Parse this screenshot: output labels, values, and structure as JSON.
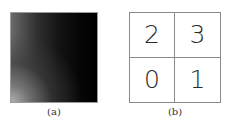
{
  "panel_a": {
    "caption": "(a)",
    "description": "grayscale gradient square, bright at bottom-left fading to black toward right and top"
  },
  "panel_b": {
    "caption": "(b)",
    "grid": [
      [
        "2",
        "3"
      ],
      [
        "0",
        "1"
      ]
    ]
  }
}
